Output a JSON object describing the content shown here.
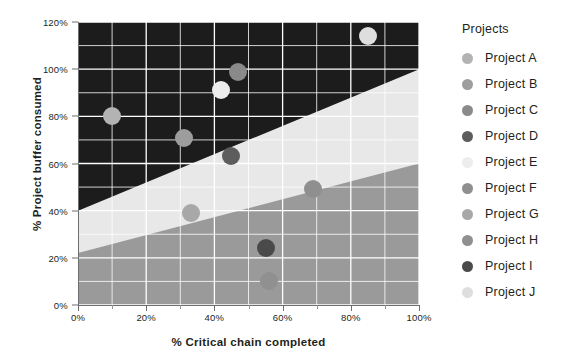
{
  "chart_data": {
    "type": "scatter",
    "title": "",
    "xlabel": "% Critical chain completed",
    "ylabel": "% Project buffer consumed",
    "xlim": [
      0,
      100
    ],
    "ylim": [
      0,
      120
    ],
    "xticks": [
      "0%",
      "20%",
      "40%",
      "60%",
      "80%",
      "100%"
    ],
    "xtick_values": [
      0,
      20,
      40,
      60,
      80,
      100
    ],
    "yticks": [
      "0%",
      "20%",
      "40%",
      "60%",
      "80%",
      "100%",
      "120%"
    ],
    "ytick_values": [
      0,
      20,
      40,
      60,
      80,
      100,
      120
    ],
    "grid": true,
    "legend_position": "right",
    "legend_title": "Projects",
    "points": [
      {
        "name": "Project A",
        "x": 10,
        "y": 80,
        "color": "#b3b3b3"
      },
      {
        "name": "Project B",
        "x": 31,
        "y": 71,
        "color": "#9d9d9d"
      },
      {
        "name": "Project C",
        "x": 47,
        "y": 99,
        "color": "#8a8a8a"
      },
      {
        "name": "Project D",
        "x": 45,
        "y": 63,
        "color": "#5d5d5d"
      },
      {
        "name": "Project E",
        "x": 42,
        "y": 91,
        "color": "#ededed"
      },
      {
        "name": "Project F",
        "x": 69,
        "y": 49,
        "color": "#8f8f8f"
      },
      {
        "name": "Project G",
        "x": 33,
        "y": 39,
        "color": "#a8a8a8"
      },
      {
        "name": "Project H",
        "x": 56,
        "y": 10,
        "color": "#909090"
      },
      {
        "name": "Project I",
        "x": 55,
        "y": 24,
        "color": "#4a4a4a"
      },
      {
        "name": "Project J",
        "x": 85,
        "y": 114,
        "color": "#dedede"
      }
    ],
    "zones": [
      {
        "name": "red-zone",
        "label": "Act",
        "color": "#1c1c1c"
      },
      {
        "name": "yellow-zone",
        "label": "Watch",
        "color": "#e8e8e8"
      },
      {
        "name": "green-zone",
        "label": "OK",
        "color": "#9a9a9a"
      }
    ],
    "zone_boundaries": {
      "upper_band_at_x0": 40,
      "upper_band_at_x100": 100,
      "lower_band_at_x0": 22,
      "lower_band_at_x100": 60,
      "top_flat_cap": 100
    },
    "extra_marker_color": "#8c8c8c"
  },
  "legend": {
    "title": "Projects",
    "items": [
      {
        "label": "Project A",
        "color": "#b3b3b3"
      },
      {
        "label": "Project B",
        "color": "#9d9d9d"
      },
      {
        "label": "Project C",
        "color": "#8a8a8a"
      },
      {
        "label": "Project D",
        "color": "#5d5d5d"
      },
      {
        "label": "Project E",
        "color": "#ededed"
      },
      {
        "label": "Project F",
        "color": "#8f8f8f"
      },
      {
        "label": "Project G",
        "color": "#a8a8a8"
      },
      {
        "label": "Project H",
        "color": "#909090"
      },
      {
        "label": "Project I",
        "color": "#4a4a4a"
      },
      {
        "label": "Project J",
        "color": "#dedede"
      }
    ]
  },
  "axes": {
    "x_title": "% Critical chain completed",
    "y_title": "% Project buffer consumed"
  },
  "colors": {
    "grid": "#ffffff",
    "axis": "#6d6e71",
    "text": "#231f20",
    "background": "#ffffff"
  }
}
